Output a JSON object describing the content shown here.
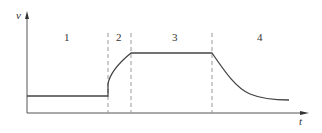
{
  "diagram": {
    "axes": {
      "y_label": "v",
      "x_label": "t"
    },
    "regions": [
      {
        "id": 1,
        "label": "1"
      },
      {
        "id": 2,
        "label": "2"
      },
      {
        "id": 3,
        "label": "3"
      },
      {
        "id": 4,
        "label": "4"
      }
    ],
    "colors": {
      "curve": "#444444",
      "axis": "#555555",
      "divider": "#999999"
    }
  }
}
